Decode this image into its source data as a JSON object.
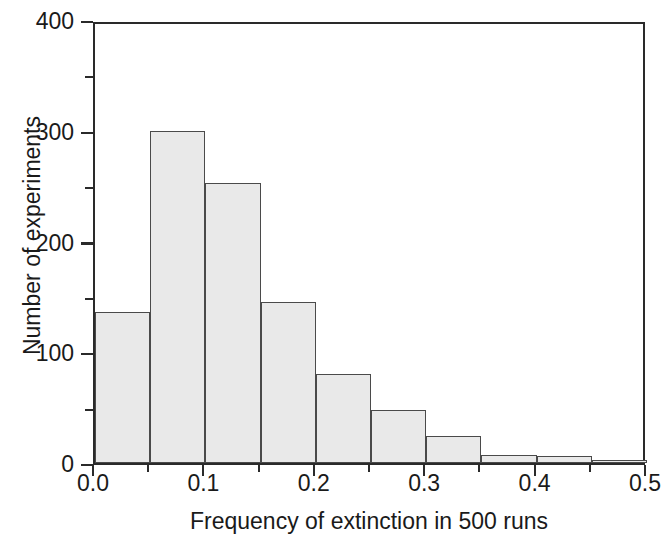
{
  "chart_data": {
    "type": "bar",
    "title": "",
    "subtitle": "",
    "xlabel": "Frequency of extinction in 500 runs",
    "ylabel": "Number of experiments",
    "xlim": [
      0.0,
      0.5
    ],
    "ylim": [
      0,
      400
    ],
    "grid": false,
    "legend": "none",
    "bin_width": 0.05,
    "bin_edges": [
      0.0,
      0.05,
      0.1,
      0.15,
      0.2,
      0.25,
      0.3,
      0.35,
      0.4,
      0.45,
      0.5
    ],
    "categories": [
      "0.00-0.05",
      "0.05-0.10",
      "0.10-0.15",
      "0.15-0.20",
      "0.20-0.25",
      "0.25-0.30",
      "0.30-0.35",
      "0.35-0.40",
      "0.40-0.45",
      "0.45-0.50"
    ],
    "values": [
      136,
      300,
      253,
      145,
      80,
      48,
      24,
      7,
      6,
      2
    ],
    "xticks": [
      0.0,
      0.1,
      0.2,
      0.3,
      0.4,
      0.5
    ],
    "xtick_labels": [
      "0.0",
      "0.1",
      "0.2",
      "0.3",
      "0.4",
      "0.5"
    ],
    "xminor_ticks": [
      0.05,
      0.15,
      0.25,
      0.35,
      0.45
    ],
    "yticks": [
      0,
      100,
      200,
      300,
      400
    ],
    "ytick_labels": [
      "0",
      "100",
      "200",
      "300",
      "400"
    ],
    "yminor_ticks": [
      50,
      150,
      250,
      350
    ],
    "bar_fill_color": "#e9e9e9",
    "bar_edge_color": "#4a4a4a",
    "axis_color": "#2a2a2a",
    "background_color": "#ffffff"
  }
}
